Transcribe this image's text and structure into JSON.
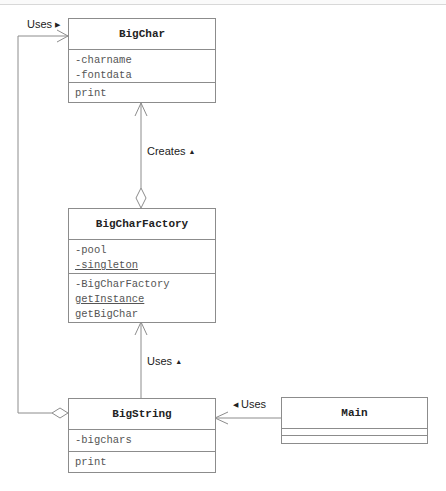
{
  "diagram": {
    "type": "UML class diagram",
    "classes": {
      "bigchar": {
        "name": "BigChar",
        "attributes": [
          "-charname",
          "-fontdata"
        ],
        "operations": [
          "print"
        ]
      },
      "factory": {
        "name": "BigCharFactory",
        "attributes": [
          "-pool",
          "-singleton"
        ],
        "operations": [
          "-BigCharFactory",
          "getInstance",
          "getBigChar"
        ]
      },
      "bigstring": {
        "name": "BigString",
        "attributes": [
          "-bigchars"
        ],
        "operations": [
          "print"
        ]
      },
      "main": {
        "name": "Main",
        "attributes": [],
        "operations": []
      }
    },
    "relations": {
      "creates": {
        "label": "Creates",
        "direction_glyph": "▲"
      },
      "factory_uses": {
        "label": "Uses",
        "direction_glyph": "▲"
      },
      "main_uses": {
        "label": "Uses",
        "direction_glyph": "◀"
      },
      "string_uses_char": {
        "label": "Uses",
        "direction_glyph": "▶"
      }
    },
    "colors": {
      "line": "#8c8c8c",
      "text": "#222222",
      "member_text": "#555555"
    }
  }
}
